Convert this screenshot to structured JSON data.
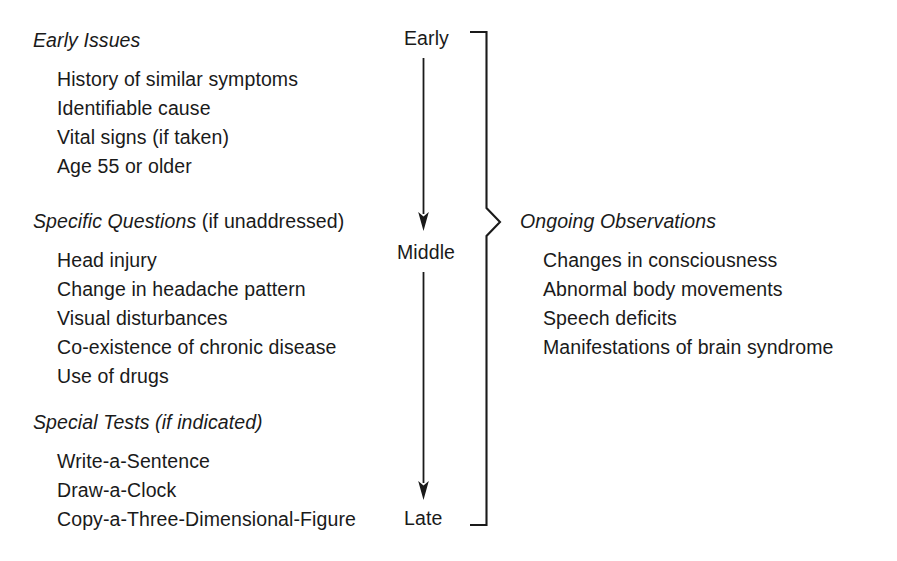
{
  "diagram": {
    "title_visible": false,
    "background_color": "#ffffff",
    "ink_color": "#1a1a1a"
  },
  "left_column": {
    "groups": [
      {
        "id": "early-issues",
        "heading": "Early Issues",
        "heading_main": "Early Issues",
        "heading_qualifier": "",
        "qualifier_style": "none",
        "items": [
          "History of similar symptoms",
          "Identifiable cause",
          "Vital signs (if taken)",
          "Age 55 or older"
        ]
      },
      {
        "id": "specific-questions",
        "heading": "Specific Questions (if unaddressed)",
        "heading_main": "Specific Questions",
        "heading_qualifier": " (if unaddressed)",
        "qualifier_style": "roman",
        "items": [
          "Head injury",
          "Change in headache pattern",
          "Visual disturbances",
          "Co-existence of chronic disease",
          "Use of drugs"
        ]
      },
      {
        "id": "special-tests",
        "heading": "Special Tests (if indicated)",
        "heading_main": "Special Tests",
        "heading_qualifier": " (if indicated)",
        "qualifier_style": "italic",
        "items": [
          "Write-a-Sentence",
          "Draw-a-Clock",
          "Copy-a-Three-Dimensional-Figure"
        ]
      }
    ]
  },
  "timeline": {
    "stages": [
      {
        "id": "early",
        "label": "Early"
      },
      {
        "id": "middle",
        "label": "Middle"
      },
      {
        "id": "late",
        "label": "Late"
      }
    ],
    "arrows": [
      {
        "from": "Early",
        "to": "Middle"
      },
      {
        "from": "Middle",
        "to": "Late"
      }
    ]
  },
  "right_column": {
    "group": {
      "id": "ongoing-observations",
      "heading": "Ongoing Observations",
      "heading_main": "Ongoing Observations",
      "heading_qualifier": "",
      "qualifier_style": "none",
      "items": [
        "Changes in consciousness",
        "Abnormal body movements",
        "Speech deficits",
        "Manifestations of brain syndrome"
      ]
    },
    "brace": {
      "orientation": "right-pointing",
      "spans_from_stage": "Early",
      "spans_to_stage": "Late"
    }
  }
}
